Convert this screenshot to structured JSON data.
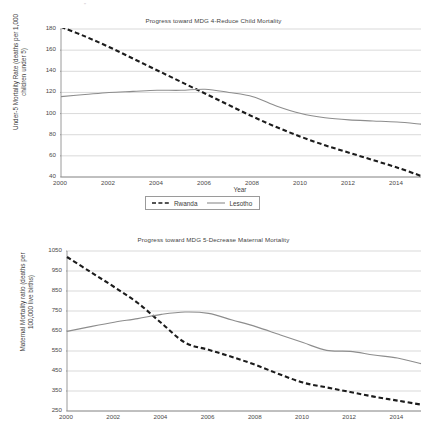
{
  "page": {
    "background_color": "#ffffff",
    "artifact_mark": "''"
  },
  "legend": {
    "entries": [
      {
        "label": "Rwanda",
        "style": "dashed",
        "color": "#1c1c1c",
        "icon": "dashed-line-swatch"
      },
      {
        "label": "Lesotho",
        "style": "solid",
        "color": "#8d8d8d",
        "icon": "solid-line-swatch"
      }
    ]
  },
  "colors": {
    "rwanda": "#1c1c1c",
    "lesotho": "#8d8d8d",
    "gridline": "#c9c9c9",
    "axis": "#8f8f8f",
    "text": "#3f3f3f"
  },
  "chart_data": [
    {
      "id": "child-mortality",
      "type": "line",
      "title": "Progress toward MDG 4-Reduce Child Mortality",
      "xlabel": "Year",
      "ylabel": "Under-5 Mortality Rate (deaths per 1,000\nchildren under 5)",
      "x": [
        2000,
        2001,
        2002,
        2003,
        2004,
        2005,
        2006,
        2007,
        2008,
        2009,
        2010,
        2011,
        2012,
        2013,
        2014,
        2015
      ],
      "xlim": [
        2000,
        2015
      ],
      "ylim": [
        40,
        180
      ],
      "xticks": [
        2000,
        2002,
        2004,
        2006,
        2008,
        2010,
        2012,
        2014
      ],
      "yticks": [
        40,
        60,
        80,
        100,
        120,
        140,
        160,
        180
      ],
      "grid": true,
      "legend_position": "below",
      "series": [
        {
          "name": "Rwanda",
          "style": "dashed",
          "color": "#1c1c1c",
          "values": [
            182,
            173,
            163,
            152,
            141,
            130,
            119,
            108,
            97,
            87,
            78,
            70,
            63,
            56,
            49,
            41
          ]
        },
        {
          "name": "Lesotho",
          "style": "solid",
          "color": "#8d8d8d",
          "values": [
            116,
            118,
            120,
            121,
            122,
            122,
            123,
            120,
            116,
            107,
            100,
            96,
            94,
            93,
            92,
            90
          ]
        }
      ]
    },
    {
      "id": "maternal-mortality",
      "type": "line",
      "title": "Progress toward MDG 5-Decrease Maternal Mortality",
      "xlabel": "",
      "ylabel": "Maternal Mortality ratio (deaths per\n100,000 live births)",
      "x": [
        2000,
        2001,
        2002,
        2003,
        2004,
        2005,
        2006,
        2007,
        2008,
        2009,
        2010,
        2011,
        2012,
        2013,
        2014,
        2015
      ],
      "xlim": [
        2000,
        2015
      ],
      "ylim": [
        250,
        1050
      ],
      "xticks": [
        2000,
        2002,
        2004,
        2006,
        2008,
        2010,
        2012,
        2014
      ],
      "yticks": [
        250,
        350,
        450,
        550,
        650,
        750,
        850,
        950,
        1050
      ],
      "grid": true,
      "legend_position": "none",
      "series": [
        {
          "name": "Rwanda",
          "style": "dashed",
          "color": "#1c1c1c",
          "values": [
            1020,
            945,
            870,
            790,
            690,
            592,
            556,
            520,
            480,
            434,
            392,
            368,
            345,
            322,
            302,
            282
          ]
        },
        {
          "name": "Lesotho",
          "style": "solid",
          "color": "#8d8d8d",
          "values": [
            648,
            672,
            694,
            712,
            733,
            745,
            738,
            705,
            672,
            632,
            592,
            553,
            548,
            530,
            515,
            487
          ]
        }
      ]
    }
  ]
}
